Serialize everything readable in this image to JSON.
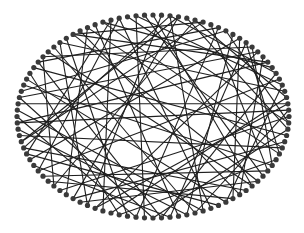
{
  "diagram": {
    "type": "circular-network-graph",
    "layout": {
      "center": [
        153,
        116.5
      ],
      "rx": 136,
      "ry": 101.5,
      "node_radius": 2.6
    },
    "node_count": 100,
    "colors": {
      "background": "#ffffff",
      "node": "#3a3a3a",
      "edge": "#1f1f1f"
    },
    "edges": [
      [
        0,
        37
      ],
      [
        1,
        58
      ],
      [
        2,
        44
      ],
      [
        3,
        71
      ],
      [
        4,
        27
      ],
      [
        5,
        63
      ],
      [
        6,
        90
      ],
      [
        7,
        34
      ],
      [
        8,
        52
      ],
      [
        9,
        79
      ],
      [
        10,
        46
      ],
      [
        11,
        68
      ],
      [
        12,
        31
      ],
      [
        13,
        85
      ],
      [
        14,
        57
      ],
      [
        15,
        39
      ],
      [
        16,
        74
      ],
      [
        17,
        94
      ],
      [
        18,
        49
      ],
      [
        19,
        66
      ],
      [
        20,
        41
      ],
      [
        21,
        88
      ],
      [
        22,
        55
      ],
      [
        23,
        77
      ],
      [
        24,
        45
      ],
      [
        25,
        62
      ],
      [
        26,
        97
      ],
      [
        27,
        50
      ],
      [
        28,
        83
      ],
      [
        29,
        60
      ],
      [
        30,
        72
      ],
      [
        31,
        92
      ],
      [
        32,
        54
      ],
      [
        33,
        80
      ],
      [
        34,
        65
      ],
      [
        35,
        99
      ],
      [
        36,
        59
      ],
      [
        37,
        86
      ],
      [
        38,
        70
      ],
      [
        39,
        91
      ],
      [
        40,
        64
      ],
      [
        41,
        81
      ],
      [
        42,
        69
      ],
      [
        43,
        96
      ],
      [
        44,
        76
      ],
      [
        45,
        87
      ],
      [
        46,
        73
      ],
      [
        47,
        93
      ],
      [
        48,
        67
      ],
      [
        49,
        84
      ],
      [
        50,
        78
      ],
      [
        51,
        98
      ],
      [
        52,
        75
      ],
      [
        53,
        89
      ],
      [
        54,
        82
      ],
      [
        56,
        95
      ],
      [
        58,
        88
      ],
      [
        61,
        92
      ],
      [
        63,
        85
      ],
      [
        66,
        96
      ],
      [
        2,
        18
      ],
      [
        5,
        22
      ],
      [
        9,
        26
      ],
      [
        13,
        33
      ],
      [
        70,
        2
      ],
      [
        78,
        14
      ],
      [
        84,
        8
      ],
      [
        90,
        16
      ],
      [
        94,
        30
      ],
      [
        98,
        20
      ],
      [
        3,
        60
      ],
      [
        11,
        40
      ],
      [
        24,
        74
      ],
      [
        36,
        90
      ],
      [
        48,
        12
      ],
      [
        57,
        23
      ],
      [
        69,
        95
      ],
      [
        71,
        6
      ]
    ]
  }
}
